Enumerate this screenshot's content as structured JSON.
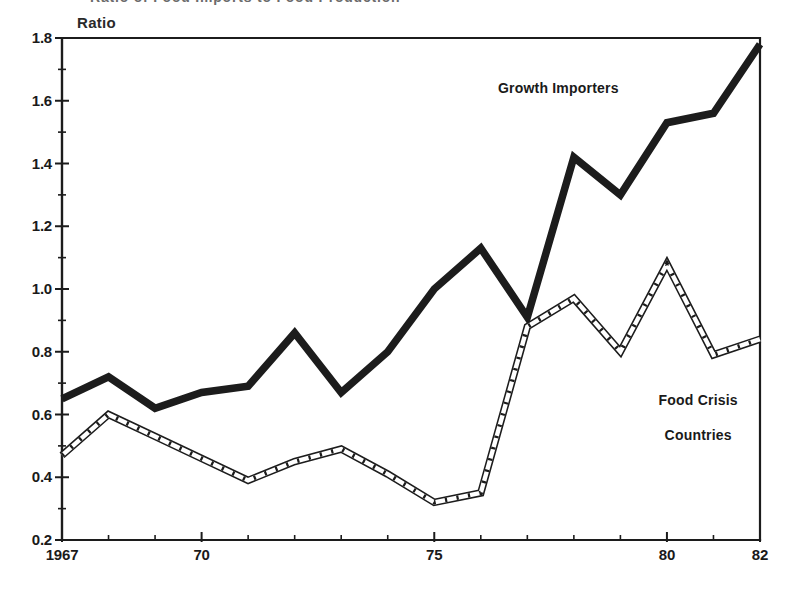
{
  "figure": {
    "clipped_title": "Ratio of Food Imports to Food Production",
    "y_axis_caption": "Ratio"
  },
  "annotations": {
    "growth_importers": "Growth Importers",
    "food_crisis_countries_line1": "Food Crisis",
    "food_crisis_countries_line2": "Countries"
  },
  "axes": {
    "y_tick_labels": [
      "1.8",
      "1.6",
      "1.4",
      "1.2",
      "1.0",
      "0.8",
      "0.6",
      "0.4",
      "0.2"
    ],
    "y_tick_values": [
      1.8,
      1.6,
      1.4,
      1.2,
      1.0,
      0.8,
      0.6,
      0.4,
      0.2
    ],
    "x_tick_labels": [
      "1967",
      "70",
      "75",
      "80",
      "82"
    ],
    "x_tick_values": [
      1967,
      1970,
      1975,
      1980,
      1982
    ]
  },
  "chart_data": {
    "type": "line",
    "title": "Ratio of Food Imports to Food Production",
    "xlabel": "",
    "ylabel": "Ratio",
    "xlim": [
      1967,
      1982
    ],
    "ylim": [
      0.2,
      1.8
    ],
    "grid": false,
    "legend_position": "inline-annotations",
    "x": [
      1967,
      1968,
      1969,
      1970,
      1971,
      1972,
      1973,
      1974,
      1975,
      1976,
      1977,
      1978,
      1979,
      1980,
      1981,
      1982
    ],
    "series": [
      {
        "name": "Growth Importers",
        "style": "solid-thick",
        "color": "#1c1c1c",
        "values": [
          0.65,
          0.72,
          0.62,
          0.67,
          0.69,
          0.86,
          0.67,
          0.8,
          1.0,
          1.13,
          0.91,
          1.42,
          1.3,
          1.53,
          1.56,
          1.78
        ]
      },
      {
        "name": "Food Crisis Countries",
        "style": "dashed-outline",
        "color": "#1c1c1c",
        "values": [
          0.47,
          0.6,
          0.53,
          0.46,
          0.39,
          0.45,
          0.49,
          0.41,
          0.32,
          0.35,
          0.88,
          0.97,
          0.8,
          1.08,
          0.79,
          0.84
        ]
      }
    ],
    "y_major_step": 0.2,
    "y_minor_step": 0.1
  }
}
